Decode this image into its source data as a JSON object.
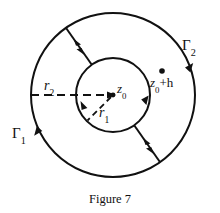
{
  "figure": {
    "caption": "Figure 7",
    "labels": {
      "outer_contour": "Γ",
      "outer_contour_sub": "2",
      "inner_contour": "Γ",
      "inner_contour_sub": "1",
      "outer_radius": "r",
      "outer_radius_sub": "2",
      "inner_radius": "r",
      "inner_radius_sub": "1",
      "center_point": "z",
      "center_point_sub": "0",
      "offset_point": "z",
      "offset_point_sub": "0",
      "offset_point_suffix": "+h"
    },
    "geometry": {
      "center_x": 113,
      "center_y": 95,
      "outer_radius_px": 82,
      "inner_radius_px": 37,
      "cut_angle_upper_deg": 125,
      "cut_angle_lower_deg": 305,
      "offset_point_x": 162,
      "offset_point_y": 71
    },
    "colors": {
      "stroke": "#111111",
      "background": "#ffffff",
      "text": "#111111"
    },
    "annotations": {
      "outer_direction": "counterclockwise",
      "inner_direction": "clockwise",
      "cut_arrows": "bidirectional on both radial cuts"
    }
  }
}
